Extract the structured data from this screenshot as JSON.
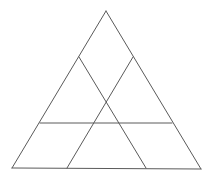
{
  "diagram": {
    "canvas": {
      "width": 211,
      "height": 181,
      "background": "#ffffff"
    },
    "stroke_color": "#5a5a5a",
    "outer_triangle": {
      "apex": [
        106,
        11
      ],
      "bottom_left": [
        12,
        168
      ],
      "bottom_right": [
        201,
        169
      ]
    },
    "segments": [
      {
        "name": "left-side",
        "from": [
          106,
          11
        ],
        "to": [
          12,
          168
        ]
      },
      {
        "name": "right-side",
        "from": [
          106,
          11
        ],
        "to": [
          201,
          169
        ]
      },
      {
        "name": "base",
        "from": [
          12,
          168
        ],
        "to": [
          201,
          169
        ]
      },
      {
        "name": "inner-diagonal-1",
        "from": [
          79,
          57
        ],
        "to": [
          146,
          168
        ]
      },
      {
        "name": "inner-diagonal-2",
        "from": [
          133,
          57
        ],
        "to": [
          67,
          168
        ]
      },
      {
        "name": "inner-horizontal",
        "from": [
          40,
          123
        ],
        "to": [
          172,
          123
        ]
      }
    ]
  }
}
